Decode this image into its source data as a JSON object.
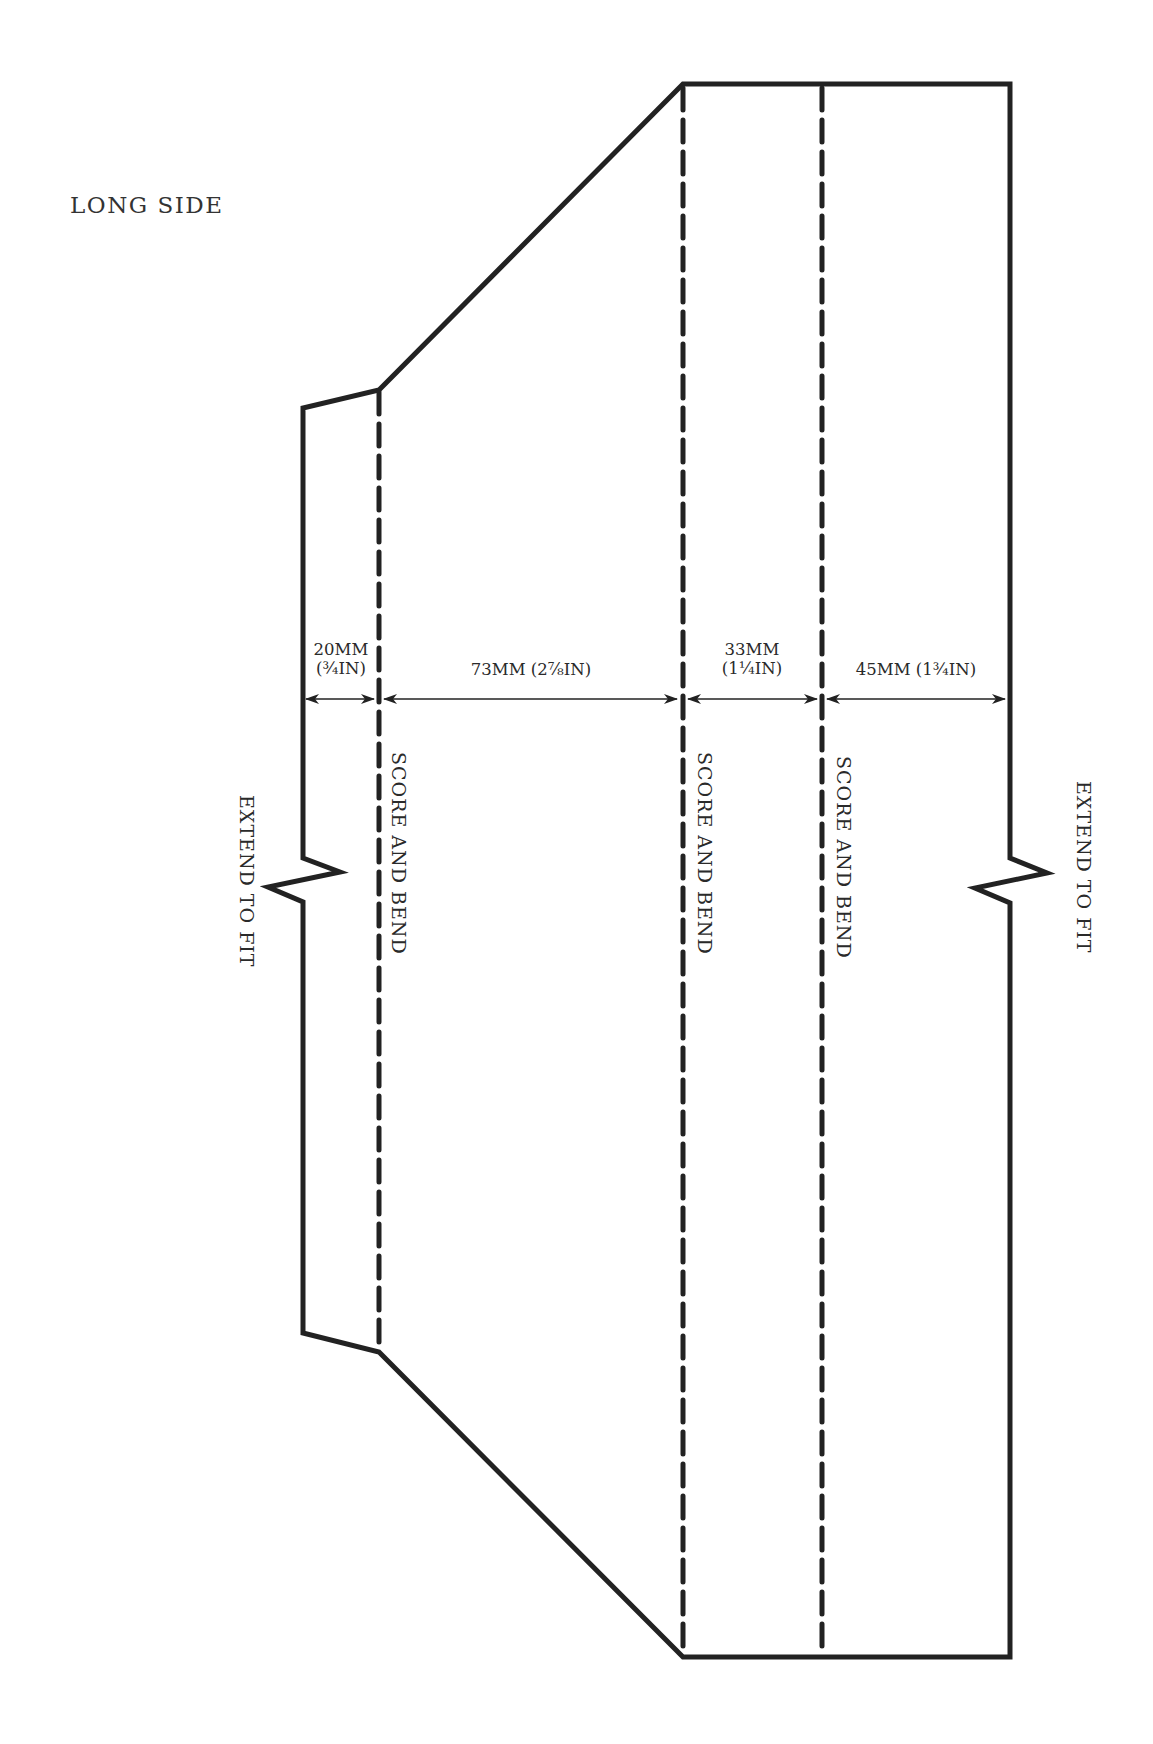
{
  "title": "LONG SIDE",
  "colors": {
    "line": "#222222",
    "text": "#2a2a2a",
    "background": "#ffffff"
  },
  "dimensions": [
    {
      "id": "tab",
      "line1": "20MM",
      "line2": "(¾IN)"
    },
    {
      "id": "slope",
      "line1": "73MM (2⅞IN)",
      "line2": ""
    },
    {
      "id": "side",
      "line1": "33MM",
      "line2": "(1¼IN)"
    },
    {
      "id": "base",
      "line1": "45MM (1¾IN)",
      "line2": ""
    }
  ],
  "fold_labels": [
    "SCORE AND BEND",
    "SCORE AND BEND",
    "SCORE AND BEND"
  ],
  "extend_labels": {
    "left": "EXTEND TO FIT",
    "right": "EXTEND TO FIT"
  }
}
